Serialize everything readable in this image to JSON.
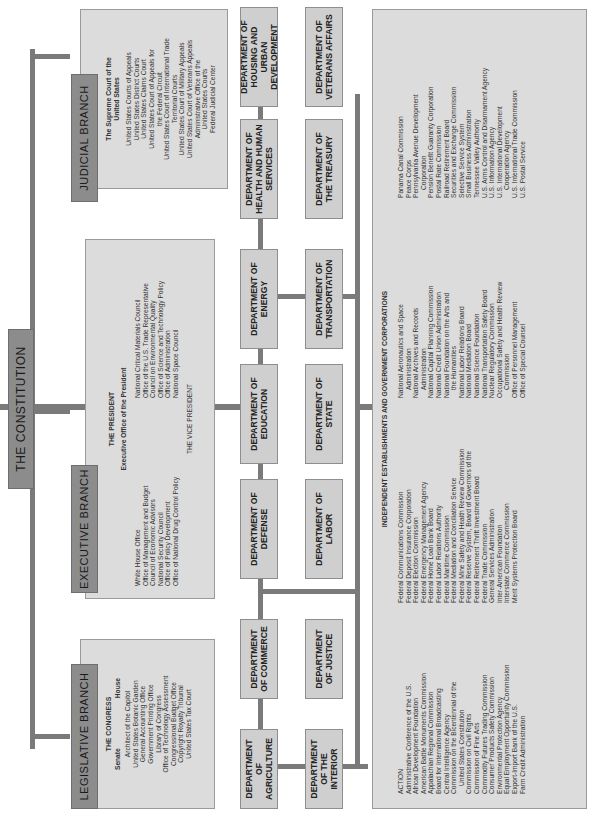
{
  "constitution": {
    "label": "THE CONSTITUTION"
  },
  "legislative": {
    "label": "LEGISLATIVE BRANCH",
    "title": "THE CONGRESS",
    "houses": [
      "Senate",
      "House"
    ],
    "items": [
      "Architect of the Capitol",
      "United States Botanic Garden",
      "General Accounting Office",
      "Government Printing Office",
      "Library of Congress",
      "Office of Technology Assessment",
      "Congressional Budget Office",
      "Copyright Royalty Tribunal",
      "United States Tax Court"
    ]
  },
  "executive": {
    "label": "EXECUTIVE BRANCH",
    "president": "THE PRESIDENT",
    "eop": "Executive Office of the President",
    "left": [
      "White House Office",
      "Office of Management and Budget",
      "Council of Economic Advisors",
      "National Security Council",
      "Office of Policy Development",
      "Office of National Drug Control Policy"
    ],
    "right": [
      "National Critical Materials Council",
      "Office of the U.S. Trade Representative",
      "Council on Environmental Quality",
      "Office of Science and Technology Policy",
      "Office of Administration",
      "National Space Council"
    ],
    "vp": "THE VICE PRESIDENT"
  },
  "judicial": {
    "label": "JUDICIAL BRANCH",
    "supreme": [
      "The Supreme Court of the",
      "United States"
    ],
    "items": [
      "United States Courts of Appeals",
      "United States District Courts",
      "United States Claims Court",
      "United States Court of Appeals for",
      "the Federal Circuit",
      "United States Court of International Trade",
      "Territorial Courts",
      "United States Court of Military Appeals",
      "United States Court of Veterans Appeals",
      "Administrative Office of the",
      "United States Courts",
      "Federal Judicial Center"
    ]
  },
  "departments": {
    "row1": [
      "DEPARTMENT OF AGRICULTURE",
      "DEPARTMENT OF COMMERCE",
      "DEPARTMENT OF DEFENSE",
      "DEPARTMENT OF EDUCATION",
      "DEPARTMENT OF ENERGY",
      "DEPARTMENT OF HEALTH AND HUMAN SERVICES",
      "DEPARTMENT OF HOUSING AND URBAN DEVELOPMENT"
    ],
    "row2": [
      "DEPARTMENT OF THE INTERIOR",
      "DEPARTMENT OF JUSTICE",
      "DEPARTMENT OF LABOR",
      "DEPARTMENT OF STATE",
      "DEPARTMENT OF TRANSPORTATION",
      "DEPARTMENT OF THE TREASURY",
      "DEPARTMENT OF VETERANS AFFAIRS"
    ]
  },
  "independent": {
    "title": "INDEPENDENT ESTABLISHMENTS AND GOVERNMENT CORPORATIONS",
    "col1": [
      "ACTION",
      "Administrative Conference of the U.S.",
      "African Development Foundation",
      "American Battle Monuments Commission",
      "Appalachian Regional Commission",
      "Board for International Broadcasting",
      "Central Intelligence Agency",
      "Commission on the Bicentennial of the",
      "  United States Constitution",
      "Commission on Civil Rights",
      "Commission of Fine Arts",
      "Commodity Futures Trading Commission",
      "Consumer Products Safety Commission",
      "Environmental Protection Agency",
      "Equal Employment Opportunity Commission",
      "Export-Import Bank of the U.S.",
      "Farm Credit Administration"
    ],
    "col2": [
      "Federal Communications Commission",
      "Federal Deposit Insurance Corporation",
      "Federal Election Commission",
      "Federal Emergency Management Agency",
      "Federal Home Loan Bank Board",
      "Federal Labor Relations Authority",
      "Federal Maritime Commission",
      "Federal Mediation and Conciliation Service",
      "Federal Mine Safety and Health Review Commission",
      "Federal Reserve System, Board of Governors of the",
      "Federal Retirement Thrift Investment Board",
      "Federal Trade Commission",
      "General Services Administration",
      "Inter-American Foundation",
      "Interstate Commerce Commission",
      "Merit Systems Protection Board"
    ],
    "col3": [
      "National Aeronautics and Space",
      "  Administration",
      "National Archives and Records",
      "  Administration",
      "National Capital Planning Commission",
      "National Credit Union Administration",
      "National Foundation on the Arts and",
      "  the Humanities",
      "National Labor Relations Board",
      "National Mediation Board",
      "National Science Foundation",
      "National Transportation Safety Board",
      "Nuclear Regulatory Commission",
      "Occupational Safety and Health Review",
      "  Commission",
      "Office of Personnel Management",
      "Office of Special Counsel"
    ],
    "col4": [
      "Panama Canal Commission",
      "Peace Corps",
      "Pennsylvania Avenue Development",
      "  Corporation",
      "Pension Benefit Guaranty Corporation",
      "Postal Rate Commission",
      "Railroad Retirement Board",
      "Securities and Exchange Commission",
      "Selective Service System",
      "Small Business Administration",
      "Tennessee Valley Authority",
      "U.S. Arms Control and Disarmament Agency",
      "U.S. Information Agency",
      "U.S. International Development",
      "  Cooperation Agency",
      "U.S. International Trade Commission",
      "U.S. Postal Service"
    ]
  }
}
